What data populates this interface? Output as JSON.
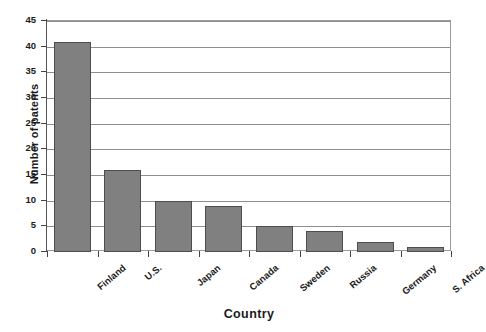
{
  "chart_data": {
    "type": "bar",
    "title": "",
    "xlabel": "Country",
    "ylabel": "Number of patents",
    "categories": [
      "Finland",
      "U.S.",
      "Japan",
      "Canada",
      "Sweden",
      "Russia",
      "Germany",
      "S. Africa"
    ],
    "values": [
      41,
      16,
      10,
      9,
      5,
      4,
      2,
      1
    ],
    "ylim": [
      0,
      45
    ],
    "ytick_labels": [
      "0",
      "5",
      "10",
      "15",
      "20",
      "25",
      "30",
      "35",
      "40",
      "45"
    ],
    "ytick_values": [
      0,
      5,
      10,
      15,
      20,
      25,
      30,
      35,
      40,
      45
    ],
    "grid": "horizontal",
    "legend": "none",
    "series": [
      {
        "name": "Number of patents",
        "values": [
          41,
          16,
          10,
          9,
          5,
          4,
          2,
          1
        ],
        "color": "#808080",
        "edge_color": "#4d4d4d"
      }
    ],
    "colors": {
      "bar_fill": "#808080",
      "bar_edge": "#4d4d4d",
      "gridline": "#8e8e8e",
      "axis": "#555555",
      "text": "#1a1a1a",
      "background": "#ffffff"
    }
  }
}
